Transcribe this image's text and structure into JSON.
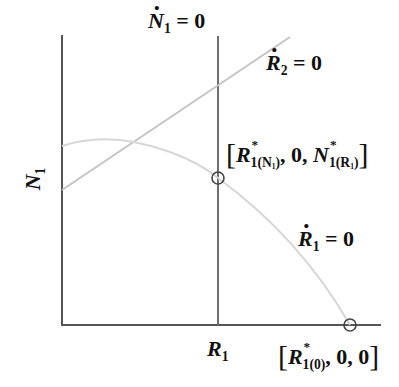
{
  "diagram": {
    "axis_y_label": "N",
    "axis_y_sub": "1",
    "axis_x_tick_label": "R",
    "axis_x_tick_sub": "1",
    "isocline_n1": {
      "var": "N",
      "sub": "1",
      "eq": " = 0"
    },
    "isocline_r2": {
      "var": "R",
      "sub": "2",
      "eq": " = 0"
    },
    "isocline_r1": {
      "var": "R",
      "sub": "1",
      "eq": " = 0"
    },
    "equilibrium_interior": {
      "open": "[",
      "r": "R",
      "r_star": "*",
      "r_sub": "1(N",
      "r_sub2": "1",
      "r_sub_close": ")",
      "mid": ", 0, ",
      "n": "N",
      "n_star": "*",
      "n_sub": "1(R",
      "n_sub2": "1",
      "n_sub_close": ")",
      "close": "]"
    },
    "equilibrium_boundary": {
      "open": "[",
      "r": "R",
      "r_star": "*",
      "r_sub": "1(0)",
      "rest": ", 0, 0",
      "close": "]"
    },
    "colors": {
      "axes": "#555555",
      "n1_isocline": "#6e6e6e",
      "r2_isocline": "#c4c4c4",
      "r1_isocline": "#d4d4d4",
      "text": "#111111"
    }
  }
}
